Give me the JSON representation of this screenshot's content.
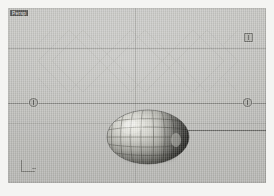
{
  "viewport": {
    "label": "Persp",
    "background_color": "#bdbdb9",
    "page_background_color": "#f4f4f2"
  },
  "object": {
    "name": "ellipsoid-mesh",
    "shape": "ellipsoid",
    "surface": "wireframe-shaded",
    "wire_color": "#3a3a38",
    "highlight_color": "#e9e9e4",
    "shadow_color": "#2a2a28",
    "latitude_lines": 5,
    "longitude_lines": 10
  },
  "lattice": {
    "name": "diamond-lattice-pattern",
    "stroke_color": "#a9a9a5"
  },
  "guides": {
    "horizon_line_color": "#5a5a56",
    "grid_line_color": "#96968f",
    "ray_color": "#3c3c3a"
  },
  "handles": [
    {
      "name": "handle-left",
      "tooltip": ""
    },
    {
      "name": "handle-right",
      "tooltip": ""
    },
    {
      "name": "handle-top-right",
      "tooltip": ""
    }
  ],
  "gizmo": {
    "name": "axis-corner-gizmo"
  }
}
